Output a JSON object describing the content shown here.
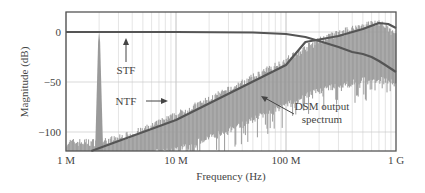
{
  "chart_data": {
    "type": "line",
    "title": "",
    "xlabel": "Frequency (Hz)",
    "ylabel": "Magnitude (dB)",
    "xscale": "log",
    "xlim": [
      1000000,
      1000000000
    ],
    "ylim": [
      -119,
      20
    ],
    "xticks": [
      {
        "value": 1000000,
        "label": "1 M"
      },
      {
        "value": 10000000,
        "label": "10 M"
      },
      {
        "value": 100000000,
        "label": "100 M"
      },
      {
        "value": 1000000000,
        "label": "1 G"
      }
    ],
    "yticks": [
      {
        "value": 0,
        "label": "0"
      },
      {
        "value": -50,
        "label": "−50"
      },
      {
        "value": -100,
        "label": "−100"
      }
    ],
    "grid": true,
    "series": [
      {
        "name": "STF",
        "color": "#555555",
        "x": [
          1000000,
          10000000,
          50000000,
          100000000,
          150000000,
          200000000,
          300000000,
          400000000,
          500000000,
          600000000,
          700000000,
          800000000,
          1000000000
        ],
        "y": [
          0,
          0,
          -0.5,
          -2,
          -5,
          -9,
          -15,
          -20,
          -22,
          -25,
          -29,
          -33,
          -40
        ]
      },
      {
        "name": "NTF",
        "color": "#555555",
        "x": [
          1700000,
          10000000,
          100000000,
          150000000,
          300000000,
          500000000,
          700000000,
          850000000,
          1000000000
        ],
        "y": [
          -119,
          -88,
          -33,
          -10,
          -4,
          3,
          9,
          8,
          4
        ]
      },
      {
        "name": "DSM output spectrum",
        "color": "#9a9a9a",
        "x": [
          1000000,
          1500000,
          1950000,
          2000000,
          2050000,
          3000000,
          5000000,
          10000000,
          30000000,
          100000000,
          200000000,
          500000000,
          700000000,
          1000000000
        ],
        "y_upper": [
          -112,
          -112,
          -112,
          0,
          -112,
          -108,
          -100,
          -85,
          -60,
          -30,
          -10,
          5,
          8,
          -5
        ],
        "y_lower": [
          -119,
          -119,
          -119,
          -119,
          -119,
          -119,
          -119,
          -115,
          -95,
          -70,
          -55,
          -45,
          -45,
          -45
        ]
      }
    ],
    "annotations": [
      {
        "text": "STF",
        "x": 2600000,
        "y": -38,
        "arrow_to": [
          2600000,
          -8
        ]
      },
      {
        "text": "NTF",
        "x": 2600000,
        "y": -69,
        "arrow_to": [
          8500000,
          -69
        ]
      },
      {
        "text": "DSM output",
        "x": 200000000,
        "y": -75
      },
      {
        "text": "spectrum",
        "x": 200000000,
        "y": -88,
        "arrow_to": [
          90000000,
          -65
        ]
      }
    ]
  },
  "labels": {
    "xlabel": "Frequency (Hz)",
    "ylabel": "Magnitude (dB)",
    "stf": "STF",
    "ntf": "NTF",
    "dsm1": "DSM output",
    "dsm2": "spectrum"
  }
}
